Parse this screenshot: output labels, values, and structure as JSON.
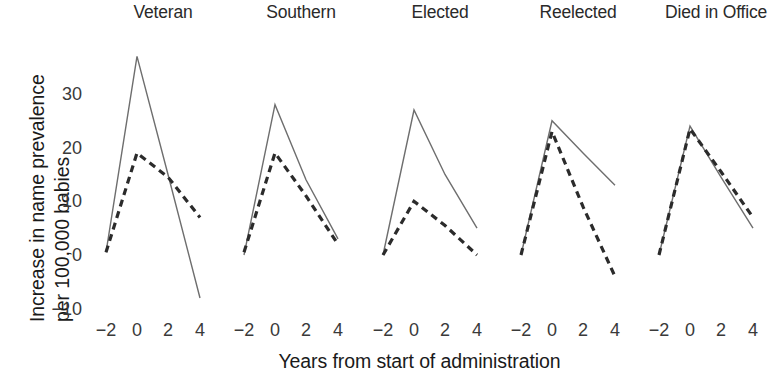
{
  "chart_data": {
    "type": "line",
    "title": "",
    "xlabel": "Years from start of administration",
    "ylabel_line1": "Increase in name prevalence",
    "ylabel_line2": "per 100,000 babies",
    "x": [
      -2,
      0,
      2,
      4
    ],
    "xticks": [
      "−2",
      "0",
      "2",
      "4"
    ],
    "yticks": [
      "30",
      "20",
      "10",
      "0",
      "−10"
    ],
    "ytick_values": [
      30,
      20,
      10,
      0,
      -10
    ],
    "xlim": [
      -2.6,
      4.6
    ],
    "ylim": [
      -13,
      40
    ],
    "grid": false,
    "legend": "none",
    "series_styles": [
      {
        "name": "solid",
        "dash": "none",
        "color": "#6e6e6e",
        "width": 1.4
      },
      {
        "name": "dashed",
        "dash": "7,5",
        "color": "#2b2b2b",
        "width": 3.2
      }
    ],
    "panels": [
      {
        "label": "Veteran",
        "series": [
          {
            "name": "solid",
            "values": [
              0.5,
              37.0,
              15.0,
              -8.0
            ]
          },
          {
            "name": "dashed",
            "values": [
              0.5,
              19.0,
              14.5,
              7.0
            ]
          }
        ]
      },
      {
        "label": "Southern",
        "series": [
          {
            "name": "solid",
            "values": [
              0.0,
              28.0,
              14.0,
              3.0
            ]
          },
          {
            "name": "dashed",
            "values": [
              0.5,
              19.0,
              11.0,
              2.0
            ]
          }
        ]
      },
      {
        "label": "Elected",
        "series": [
          {
            "name": "solid",
            "values": [
              0.0,
              27.0,
              15.0,
              5.0
            ]
          },
          {
            "name": "dashed",
            "values": [
              0.0,
              10.0,
              5.5,
              0.0
            ]
          }
        ]
      },
      {
        "label": "Reelected",
        "series": [
          {
            "name": "solid",
            "values": [
              0.0,
              25.0,
              19.0,
              13.0
            ]
          },
          {
            "name": "dashed",
            "values": [
              0.0,
              23.0,
              9.0,
              -4.0
            ]
          }
        ]
      },
      {
        "label": "Died in Office",
        "series": [
          {
            "name": "solid",
            "values": [
              0.0,
              24.0,
              14.5,
              5.0
            ]
          },
          {
            "name": "dashed",
            "values": [
              0.0,
              23.5,
              15.5,
              7.0
            ]
          }
        ]
      }
    ]
  }
}
